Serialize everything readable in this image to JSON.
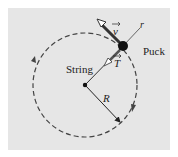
{
  "diagram": {
    "labels": {
      "velocity": "v",
      "tension": "T",
      "radial_axis": "r",
      "puck": "Puck",
      "string": "String",
      "radius": "R"
    },
    "colors": {
      "background": "#e6e6e6",
      "ink": "#222222",
      "vector_fill": "#ffffff"
    }
  }
}
